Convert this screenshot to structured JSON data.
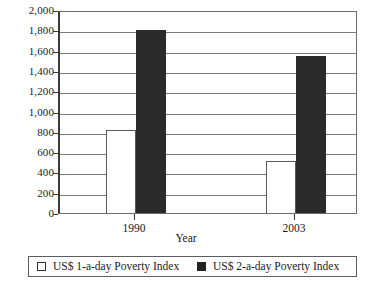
{
  "chart_data": {
    "type": "bar",
    "title": "",
    "xlabel": "Year",
    "ylabel": "",
    "categories": [
      "1990",
      "2003"
    ],
    "series": [
      {
        "name": "US$ 1-a-day Poverty Index",
        "color": "#ffffff",
        "values": [
          820,
          510
        ]
      },
      {
        "name": "US$ 2-a-day Poverty Index",
        "color": "#2b2b2b",
        "values": [
          1800,
          1550
        ]
      }
    ],
    "ylim": [
      0,
      2000
    ],
    "ytick_step": 200,
    "ytick_labels": [
      "0",
      "200",
      "400",
      "600",
      "800",
      "1,000",
      "1,200",
      "1,400",
      "1,600",
      "1,800",
      "2,000"
    ],
    "ytick_values": [
      0,
      200,
      400,
      600,
      800,
      1000,
      1200,
      1400,
      1600,
      1800,
      2000
    ],
    "grid": true,
    "legend_position": "bottom"
  },
  "legend": {
    "entries": [
      {
        "label": "US$ 1-a-day Poverty Index",
        "swatch": "light-square-swatch"
      },
      {
        "label": "US$ 2-a-day Poverty Index",
        "swatch": "dark-square-swatch"
      }
    ]
  }
}
